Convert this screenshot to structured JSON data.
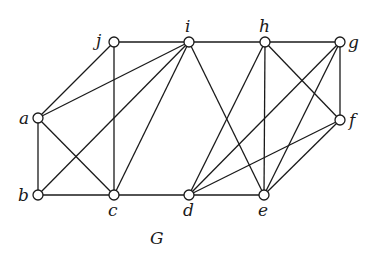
{
  "diagram": {
    "title": "G",
    "title_pos": [
      150,
      244
    ],
    "node_radius": 5,
    "colors": {
      "stroke": "#1a1a1a",
      "fill": "#ffffff",
      "background": "#ffffff"
    },
    "nodes": [
      {
        "id": "a",
        "label": "a",
        "x": 38,
        "y": 118,
        "lx": 19,
        "ly": 124
      },
      {
        "id": "b",
        "label": "b",
        "x": 38,
        "y": 195,
        "lx": 18,
        "ly": 201
      },
      {
        "id": "c",
        "label": "c",
        "x": 114,
        "y": 195,
        "lx": 108,
        "ly": 216
      },
      {
        "id": "d",
        "label": "d",
        "x": 189,
        "y": 195,
        "lx": 183,
        "ly": 216
      },
      {
        "id": "e",
        "label": "e",
        "x": 264,
        "y": 195,
        "lx": 258,
        "ly": 216
      },
      {
        "id": "f",
        "label": "f",
        "x": 340,
        "y": 120,
        "lx": 349,
        "ly": 126
      },
      {
        "id": "g",
        "label": "g",
        "x": 340,
        "y": 42,
        "lx": 348,
        "ly": 48
      },
      {
        "id": "h",
        "label": "h",
        "x": 265,
        "y": 42,
        "lx": 259,
        "ly": 32
      },
      {
        "id": "i",
        "label": "i",
        "x": 189,
        "y": 42,
        "lx": 185,
        "ly": 32
      },
      {
        "id": "j",
        "label": "j",
        "x": 114,
        "y": 42,
        "lx": 96,
        "ly": 46
      }
    ],
    "edges": [
      [
        "a",
        "b"
      ],
      [
        "a",
        "c"
      ],
      [
        "a",
        "j"
      ],
      [
        "a",
        "i"
      ],
      [
        "b",
        "c"
      ],
      [
        "b",
        "i"
      ],
      [
        "c",
        "j"
      ],
      [
        "c",
        "i"
      ],
      [
        "c",
        "d"
      ],
      [
        "j",
        "i"
      ],
      [
        "i",
        "h"
      ],
      [
        "i",
        "e"
      ],
      [
        "h",
        "g"
      ],
      [
        "h",
        "d"
      ],
      [
        "h",
        "e"
      ],
      [
        "h",
        "f"
      ],
      [
        "g",
        "f"
      ],
      [
        "g",
        "d"
      ],
      [
        "g",
        "e"
      ],
      [
        "f",
        "d"
      ],
      [
        "f",
        "e"
      ],
      [
        "d",
        "e"
      ]
    ]
  }
}
